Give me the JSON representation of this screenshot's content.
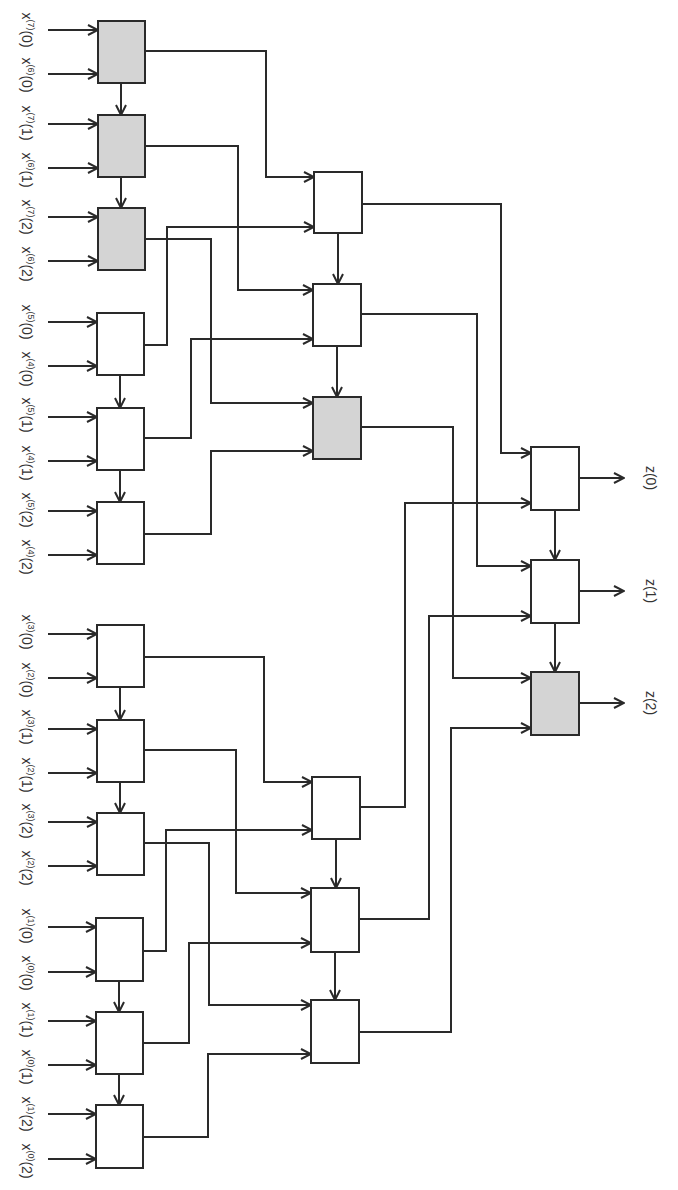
{
  "colors": {
    "line": "#2a2a2a",
    "box_fill_white": "#ffffff",
    "box_fill_gray": "#d4d4d4",
    "text": "#333333"
  },
  "input_labels": [
    {
      "text": "x(7)(0)",
      "base": "x",
      "sup": "(7)",
      "arg": "(0)",
      "y": 30
    },
    {
      "text": "x(6)(0)",
      "base": "x",
      "sup": "(6)",
      "arg": "(0)",
      "y": 75
    },
    {
      "text": "x(7)(1)",
      "base": "x",
      "sup": "(7)",
      "arg": "(1)",
      "y": 123
    },
    {
      "text": "x(6)(1)",
      "base": "x",
      "sup": "(6)",
      "arg": "(1)",
      "y": 170
    },
    {
      "text": "x(7)(2)",
      "base": "x",
      "sup": "(7)",
      "arg": "(2)",
      "y": 217
    },
    {
      "text": "x(6)(2)",
      "base": "x",
      "sup": "(6)",
      "arg": "(2)",
      "y": 264
    },
    {
      "text": "x(5)(0)",
      "base": "x",
      "sup": "(5)",
      "arg": "(0)",
      "y": 322
    },
    {
      "text": "x(4)(0)",
      "base": "x",
      "sup": "(4)",
      "arg": "(0)",
      "y": 369
    },
    {
      "text": "x(5)(1)",
      "base": "x",
      "sup": "(5)",
      "arg": "(1)",
      "y": 415
    },
    {
      "text": "x(4)(1)",
      "base": "x",
      "sup": "(4)",
      "arg": "(1)",
      "y": 463
    },
    {
      "text": "x(5)(2)",
      "base": "x",
      "sup": "(5)",
      "arg": "(2)",
      "y": 510
    },
    {
      "text": "x(4)(2)",
      "base": "x",
      "sup": "(4)",
      "arg": "(2)",
      "y": 557
    },
    {
      "text": "x(3)(0)",
      "base": "x",
      "sup": "(3)",
      "arg": "(0)",
      "y": 632
    },
    {
      "text": "x(2)(0)",
      "base": "x",
      "sup": "(2)",
      "arg": "(0)",
      "y": 680
    },
    {
      "text": "x(3)(1)",
      "base": "x",
      "sup": "(3)",
      "arg": "(1)",
      "y": 727
    },
    {
      "text": "x(2)(1)",
      "base": "x",
      "sup": "(2)",
      "arg": "(1)",
      "y": 775
    },
    {
      "text": "x(3)(2)",
      "base": "x",
      "sup": "(3)",
      "arg": "(2)",
      "y": 821
    },
    {
      "text": "x(2)(2)",
      "base": "x",
      "sup": "(2)",
      "arg": "(2)",
      "y": 868
    },
    {
      "text": "x(1)(0)",
      "base": "x",
      "sup": "(1)",
      "arg": "(0)",
      "y": 926
    },
    {
      "text": "x(0)(0)",
      "base": "x",
      "sup": "(0)",
      "arg": "(0)",
      "y": 973
    },
    {
      "text": "x(1)(1)",
      "base": "x",
      "sup": "(1)",
      "arg": "(1)",
      "y": 1020
    },
    {
      "text": "x(0)(1)",
      "base": "x",
      "sup": "(0)",
      "arg": "(1)",
      "y": 1067
    },
    {
      "text": "x(1)(2)",
      "base": "x",
      "sup": "(1)",
      "arg": "(2)",
      "y": 1114
    },
    {
      "text": "x(0)(2)",
      "base": "x",
      "sup": "(0)",
      "arg": "(2)",
      "y": 1161
    }
  ],
  "output_labels": [
    {
      "text": "z(0)",
      "y": 478
    },
    {
      "text": "z(1)",
      "y": 591
    },
    {
      "text": "z(2)",
      "y": 703
    }
  ],
  "blocks": {
    "stage1": [
      {
        "id": "s1-0",
        "x": 98,
        "y": 21,
        "w": 47,
        "h": 62,
        "shaded": true
      },
      {
        "id": "s1-1",
        "x": 98,
        "y": 115,
        "w": 47,
        "h": 62,
        "shaded": true
      },
      {
        "id": "s1-2",
        "x": 98,
        "y": 208,
        "w": 47,
        "h": 62,
        "shaded": true
      },
      {
        "id": "s1-3",
        "x": 97,
        "y": 313,
        "w": 47,
        "h": 62,
        "shaded": false
      },
      {
        "id": "s1-4",
        "x": 97,
        "y": 408,
        "w": 47,
        "h": 62,
        "shaded": false
      },
      {
        "id": "s1-5",
        "x": 97,
        "y": 502,
        "w": 47,
        "h": 62,
        "shaded": false
      },
      {
        "id": "s1-6",
        "x": 97,
        "y": 625,
        "w": 47,
        "h": 62,
        "shaded": false
      },
      {
        "id": "s1-7",
        "x": 97,
        "y": 720,
        "w": 47,
        "h": 62,
        "shaded": false
      },
      {
        "id": "s1-8",
        "x": 97,
        "y": 813,
        "w": 47,
        "h": 62,
        "shaded": false
      },
      {
        "id": "s1-9",
        "x": 96,
        "y": 918,
        "w": 47,
        "h": 63,
        "shaded": false
      },
      {
        "id": "s1-10",
        "x": 96,
        "y": 1012,
        "w": 47,
        "h": 62,
        "shaded": false
      },
      {
        "id": "s1-11",
        "x": 96,
        "y": 1105,
        "w": 47,
        "h": 63,
        "shaded": false
      }
    ],
    "stage2": [
      {
        "id": "s2-0",
        "x": 314,
        "y": 172,
        "w": 48,
        "h": 61,
        "shaded": false
      },
      {
        "id": "s2-1",
        "x": 313,
        "y": 284,
        "w": 48,
        "h": 62,
        "shaded": false
      },
      {
        "id": "s2-2",
        "x": 313,
        "y": 397,
        "w": 48,
        "h": 62,
        "shaded": true
      },
      {
        "id": "s2-3",
        "x": 312,
        "y": 777,
        "w": 48,
        "h": 62,
        "shaded": false
      },
      {
        "id": "s2-4",
        "x": 311,
        "y": 888,
        "w": 48,
        "h": 64,
        "shaded": false
      },
      {
        "id": "s2-5",
        "x": 311,
        "y": 1000,
        "w": 48,
        "h": 63,
        "shaded": false
      }
    ],
    "stage3": [
      {
        "id": "s3-0",
        "x": 531,
        "y": 447,
        "w": 48,
        "h": 63,
        "shaded": false
      },
      {
        "id": "s3-1",
        "x": 531,
        "y": 560,
        "w": 48,
        "h": 63,
        "shaded": false
      },
      {
        "id": "s3-2",
        "x": 531,
        "y": 672,
        "w": 48,
        "h": 63,
        "shaded": true
      }
    ]
  },
  "wires": [
    {
      "from": "s1-0",
      "to": "s2-0",
      "points": [
        [
          145,
          51
        ],
        [
          266,
          51
        ],
        [
          266,
          177
        ],
        [
          314,
          177
        ]
      ]
    },
    {
      "from": "s1-1",
      "to": "s2-1",
      "points": [
        [
          145,
          146
        ],
        [
          238,
          146
        ],
        [
          238,
          290
        ],
        [
          313,
          290
        ]
      ]
    },
    {
      "from": "s1-2",
      "to": "s2-2",
      "points": [
        [
          145,
          239
        ],
        [
          211,
          239
        ],
        [
          211,
          403
        ],
        [
          313,
          403
        ]
      ]
    },
    {
      "from": "s1-3",
      "to": "s2-0",
      "points": [
        [
          144,
          345
        ],
        [
          167,
          345
        ],
        [
          167,
          227
        ],
        [
          314,
          227
        ]
      ]
    },
    {
      "from": "s1-4",
      "to": "s2-1",
      "points": [
        [
          144,
          438
        ],
        [
          191,
          438
        ],
        [
          191,
          339
        ],
        [
          313,
          339
        ]
      ]
    },
    {
      "from": "s1-5",
      "to": "s2-2",
      "points": [
        [
          144,
          534
        ],
        [
          211,
          534
        ],
        [
          211,
          451
        ],
        [
          313,
          451
        ]
      ]
    },
    {
      "from": "s1-6",
      "to": "s2-3",
      "points": [
        [
          144,
          657
        ],
        [
          264,
          657
        ],
        [
          264,
          782
        ],
        [
          312,
          782
        ]
      ]
    },
    {
      "from": "s1-7",
      "to": "s2-4",
      "points": [
        [
          144,
          750
        ],
        [
          236,
          750
        ],
        [
          236,
          893
        ],
        [
          311,
          893
        ]
      ]
    },
    {
      "from": "s1-8",
      "to": "s2-5",
      "points": [
        [
          144,
          843
        ],
        [
          209,
          843
        ],
        [
          209,
          1005
        ],
        [
          311,
          1005
        ]
      ]
    },
    {
      "from": "s1-9",
      "to": "s2-3",
      "points": [
        [
          143,
          951
        ],
        [
          166,
          951
        ],
        [
          166,
          830
        ],
        [
          312,
          830
        ]
      ]
    },
    {
      "from": "s1-10",
      "to": "s2-4",
      "points": [
        [
          143,
          1043
        ],
        [
          189,
          1043
        ],
        [
          189,
          943
        ],
        [
          311,
          943
        ]
      ]
    },
    {
      "from": "s1-11",
      "to": "s2-5",
      "points": [
        [
          143,
          1137
        ],
        [
          208,
          1137
        ],
        [
          208,
          1054
        ],
        [
          311,
          1054
        ]
      ]
    },
    {
      "from": "s2-0",
      "to": "s3-0",
      "points": [
        [
          362,
          204
        ],
        [
          501,
          204
        ],
        [
          501,
          453
        ],
        [
          531,
          453
        ]
      ]
    },
    {
      "from": "s2-1",
      "to": "s3-1",
      "points": [
        [
          361,
          314
        ],
        [
          477,
          314
        ],
        [
          477,
          566
        ],
        [
          531,
          566
        ]
      ]
    },
    {
      "from": "s2-2",
      "to": "s3-2",
      "points": [
        [
          361,
          427
        ],
        [
          453,
          427
        ],
        [
          453,
          678
        ],
        [
          531,
          678
        ]
      ]
    },
    {
      "from": "s2-3",
      "to": "s3-0",
      "points": [
        [
          360,
          807
        ],
        [
          405,
          807
        ],
        [
          405,
          503
        ],
        [
          531,
          503
        ]
      ]
    },
    {
      "from": "s2-4",
      "to": "s3-1",
      "points": [
        [
          359,
          919
        ],
        [
          429,
          919
        ],
        [
          429,
          616
        ],
        [
          531,
          616
        ]
      ]
    },
    {
      "from": "s2-5",
      "to": "s3-2",
      "points": [
        [
          359,
          1032
        ],
        [
          451,
          1032
        ],
        [
          451,
          728
        ],
        [
          531,
          728
        ]
      ]
    }
  ],
  "chain_arrows": [
    {
      "x": 121,
      "y1": 83,
      "y2": 115
    },
    {
      "x": 121,
      "y1": 177,
      "y2": 208
    },
    {
      "x": 120,
      "y1": 375,
      "y2": 408
    },
    {
      "x": 120,
      "y1": 470,
      "y2": 502
    },
    {
      "x": 120,
      "y1": 687,
      "y2": 720
    },
    {
      "x": 120,
      "y1": 782,
      "y2": 813
    },
    {
      "x": 119,
      "y1": 981,
      "y2": 1012
    },
    {
      "x": 119,
      "y1": 1074,
      "y2": 1105
    },
    {
      "x": 338,
      "y1": 233,
      "y2": 284
    },
    {
      "x": 337,
      "y1": 346,
      "y2": 397
    },
    {
      "x": 336,
      "y1": 839,
      "y2": 888
    },
    {
      "x": 335,
      "y1": 952,
      "y2": 1000
    },
    {
      "x": 555,
      "y1": 510,
      "y2": 560
    },
    {
      "x": 555,
      "y1": 623,
      "y2": 672
    }
  ],
  "output_arrows": [
    {
      "x1": 579,
      "x2": 624,
      "y": 478
    },
    {
      "x1": 579,
      "x2": 624,
      "y": 591
    },
    {
      "x1": 579,
      "x2": 624,
      "y": 703
    }
  ]
}
